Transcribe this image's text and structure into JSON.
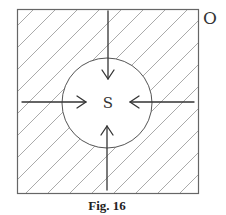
{
  "figure": {
    "caption": "Fig. 16",
    "outer_label": "O",
    "center_label": "S",
    "region": {
      "shape": "square",
      "fill": "diagonal-hatch",
      "stroke_color": "#666666",
      "hatch_color": "#aaaaaa"
    },
    "inner_region": {
      "shape": "circle",
      "fill": "none",
      "stroke_color": "#555555"
    },
    "arrows": [
      {
        "name": "arrow-from-top",
        "direction": "down"
      },
      {
        "name": "arrow-from-left",
        "direction": "right"
      },
      {
        "name": "arrow-from-right",
        "direction": "left"
      },
      {
        "name": "arrow-from-bottom",
        "direction": "up"
      }
    ]
  }
}
